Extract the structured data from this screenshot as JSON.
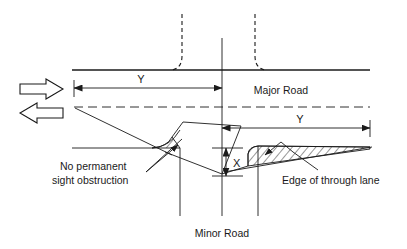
{
  "diagram": {
    "labels": {
      "major_road": "Major Road",
      "minor_road": "Minor Road",
      "dim_y_left": "Y",
      "dim_y_right": "Y",
      "dim_x": "X",
      "note_left_line1": "No permanent",
      "note_left_line2": "sight obstruction",
      "note_right": "Edge of through lane"
    },
    "icons": {
      "traffic_arrow_right": "arrow-right-block",
      "traffic_arrow_left": "arrow-left-block"
    },
    "colors": {
      "ink": "#1a1a1a",
      "background": "#ffffff"
    }
  }
}
